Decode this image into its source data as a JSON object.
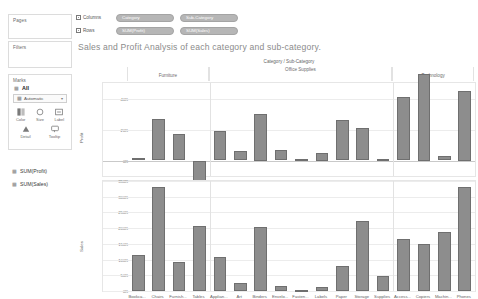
{
  "left_panel": {
    "pages_label": "Pages",
    "filters_label": "Filters",
    "marks_label": "Marks",
    "marks_all_label": "All",
    "mark_type": "Automatic",
    "mark_buttons": [
      {
        "caption": "Color",
        "icon": "color-icon"
      },
      {
        "caption": "Size",
        "icon": "size-icon"
      },
      {
        "caption": "Label",
        "icon": "label-icon"
      },
      {
        "caption": "Detail",
        "icon": "detail-icon"
      },
      {
        "caption": "Tooltip",
        "icon": "tooltip-icon"
      }
    ],
    "measures": [
      "SUM(Profit)",
      "SUM(Sales)"
    ]
  },
  "shelves": {
    "columns_label": "Columns",
    "rows_label": "Rows",
    "columns_pills": [
      "Category",
      "Sub-Category"
    ],
    "rows_pills": [
      "SUM(Profit)",
      "SUM(Sales)"
    ]
  },
  "viz": {
    "title": "Sales and Profit Analysis of each category and sub-category.",
    "header_caption": "Category / Sub-Category"
  },
  "chart_data": {
    "type": "bar",
    "title": "Sales and Profit Analysis of each category and sub-category.",
    "xlabel": "Category / Sub-Category",
    "categories": [
      "Bookca...",
      "Chairs",
      "Furnish...",
      "Tables",
      "Applian...",
      "Art",
      "Binders",
      "Envelo...",
      "Fasten...",
      "Labels",
      "Paper",
      "Storage",
      "Supplies",
      "Access...",
      "Copiers",
      "Machin...",
      "Phones"
    ],
    "category_groups": [
      {
        "name": "Furniture",
        "start": 0,
        "count": 4
      },
      {
        "name": "Office Supplies",
        "start": 4,
        "count": 9
      },
      {
        "name": "Technology",
        "start": 13,
        "count": 4
      }
    ],
    "panels": [
      {
        "name": "profit",
        "ylabel": "Profit",
        "ylim": [
          -10000,
          50000
        ],
        "ticks": [
          {
            "value": 40000,
            "label": "40K"
          },
          {
            "value": 20000,
            "label": "20K"
          },
          {
            "value": 0,
            "label": "0K"
          }
        ],
        "values": [
          1500,
          27000,
          17000,
          -18000,
          19000,
          6000,
          30000,
          7000,
          1000,
          5000,
          26000,
          21000,
          1000,
          41000,
          56000,
          3000,
          45000
        ]
      },
      {
        "name": "sales",
        "ylabel": "Sales",
        "ylim": [
          0,
          350000
        ],
        "ticks": [
          {
            "value": 350000,
            "label": "350K"
          },
          {
            "value": 300000,
            "label": "300K"
          },
          {
            "value": 250000,
            "label": "250K"
          },
          {
            "value": 200000,
            "label": "200K"
          },
          {
            "value": 150000,
            "label": "150K"
          },
          {
            "value": 100000,
            "label": "100K"
          },
          {
            "value": 50000,
            "label": "50K"
          },
          {
            "value": 0,
            "label": "0K"
          }
        ],
        "values": [
          115000,
          330000,
          92000,
          207000,
          108000,
          27000,
          204000,
          16000,
          3000,
          12000,
          79000,
          223000,
          47000,
          167000,
          150000,
          189000,
          330000
        ]
      }
    ]
  }
}
